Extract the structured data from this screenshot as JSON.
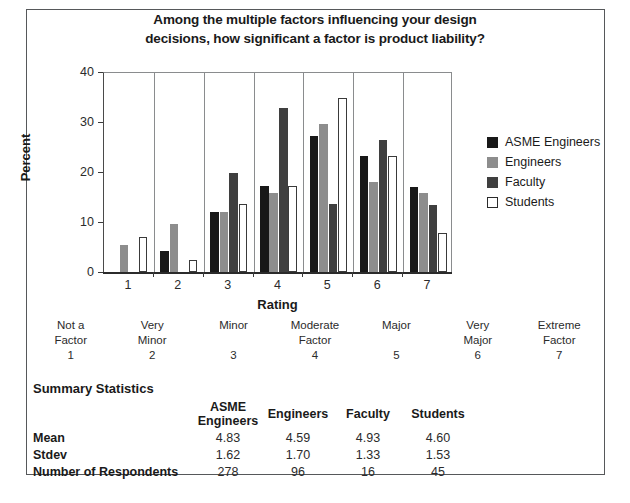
{
  "chart_data": {
    "type": "bar",
    "title": "Among the multiple factors influencing your design decisions, how significant a factor is product liability?",
    "title_line1": "Among the multiple factors influencing your design",
    "title_line2": "decisions, how significant a factor is product liability?",
    "xlabel": "Rating",
    "ylabel": "Percent",
    "ylim": [
      0,
      40
    ],
    "yticks": [
      0,
      10,
      20,
      30,
      40
    ],
    "grid": "vertical-separators-between-groups",
    "legend_position": "right",
    "categories": [
      "1",
      "2",
      "3",
      "4",
      "5",
      "6",
      "7"
    ],
    "series": [
      {
        "name": "ASME Engineers",
        "color": "#181818",
        "values": [
          0,
          4.3,
          12.0,
          17.2,
          27.2,
          23.3,
          17.0
        ]
      },
      {
        "name": "Engineers",
        "color": "#8d8d8d",
        "values": [
          5.4,
          9.7,
          12.0,
          15.9,
          29.6,
          18.1,
          15.8
        ]
      },
      {
        "name": "Faculty",
        "color": "#3f3f3f",
        "values": [
          0,
          0,
          19.8,
          32.8,
          13.6,
          26.5,
          13.4
        ]
      },
      {
        "name": "Students",
        "color": "#ffffff",
        "values": [
          7.0,
          2.4,
          13.6,
          17.2,
          34.8,
          23.3,
          7.8
        ]
      }
    ]
  },
  "scale": {
    "items": [
      {
        "line1": "Not a",
        "line2": "Factor",
        "number": "1"
      },
      {
        "line1": "Very",
        "line2": "Minor",
        "number": "2"
      },
      {
        "line1": "Minor",
        "line2": "",
        "number": "3"
      },
      {
        "line1": "Moderate",
        "line2": "Factor",
        "number": "4"
      },
      {
        "line1": "Major",
        "line2": "",
        "number": "5"
      },
      {
        "line1": "Very",
        "line2": "Major",
        "number": "6"
      },
      {
        "line1": "Extreme",
        "line2": "Factor",
        "number": "7"
      }
    ]
  },
  "summary": {
    "heading": "Summary Statistics",
    "columns": [
      "ASME Engineers",
      "Engineers",
      "Faculty",
      "Students"
    ],
    "rows": [
      {
        "label": "Mean",
        "values": [
          "4.83",
          "4.59",
          "4.93",
          "4.60"
        ]
      },
      {
        "label": "Stdev",
        "values": [
          "1.62",
          "1.70",
          "1.33",
          "1.53"
        ]
      },
      {
        "label": "Number of Respondents",
        "values": [
          "278",
          "96",
          "16",
          "45"
        ]
      }
    ]
  },
  "caption": ""
}
